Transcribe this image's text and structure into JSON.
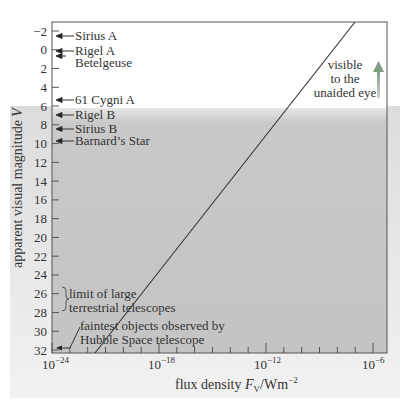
{
  "chart_data": {
    "type": "line",
    "title": "",
    "xlabel": "flux density F_V/Wm^-2",
    "ylabel": "apparent visual magnitude V",
    "x_scale": "log",
    "xlim": [
      "1e-24",
      "1e-6"
    ],
    "ylim": [
      -2,
      32
    ],
    "y_inverted": true,
    "x_tick_labels": [
      "10^-24",
      "10^-18",
      "10^-12",
      "10^-6"
    ],
    "y_tick_labels": [
      "-2",
      "0",
      "2",
      "4",
      "6",
      "8",
      "10",
      "12",
      "14",
      "16",
      "18",
      "20",
      "22",
      "24",
      "26",
      "28",
      "30",
      "32"
    ],
    "series": [
      {
        "name": "magnitude vs flux density",
        "points": [
          {
            "log10_flux": -21.6,
            "V": 32
          },
          {
            "log10_flux": -8.0,
            "V": -2.7
          }
        ]
      }
    ],
    "shaded_region": {
      "from_V": 6,
      "to_V": 32,
      "color": "#c8c8c8"
    },
    "annotations": [
      {
        "label": "Sirius A",
        "V": -1.5
      },
      {
        "label": "Rigel A",
        "V": 0.1
      },
      {
        "label": "Betelgeuse",
        "V": 0.5
      },
      {
        "label": "61 Cygni A",
        "V": 5.2
      },
      {
        "label": "Rigel B",
        "V": 6.8
      },
      {
        "label": "Sirius B",
        "V": 8.4
      },
      {
        "label": "Barnard’s Star",
        "V": 9.5
      },
      {
        "label": "limit of large terrestrial telescopes",
        "V_range": [
          25,
          27
        ]
      },
      {
        "label": "faintest objects observed by Hubble Space telescope",
        "V": 31.5
      },
      {
        "label": "visible to the unaided eye",
        "arrow": "up"
      }
    ]
  },
  "labels": {
    "xlabel_main": "flux density ",
    "xlabel_F": "F",
    "xlabel_sub": "V",
    "xlabel_unit": "/Wm",
    "xlabel_exp": "−2",
    "ylabel_main": "apparent visual magnitude ",
    "ylabel_var": "V",
    "visible_1": "visible",
    "visible_2": "to the",
    "visible_3": "unaided eye",
    "limit_1": "limit of large",
    "limit_2": "terrestrial telescopes",
    "hubble_1": "faintest objects observed by",
    "hubble_2": "Hubble Space telescope"
  },
  "colors": {
    "shade": "#c6c6c6",
    "line": "#3a3a3a",
    "arrow_green": "#8aa58a",
    "frame": "#555555"
  }
}
